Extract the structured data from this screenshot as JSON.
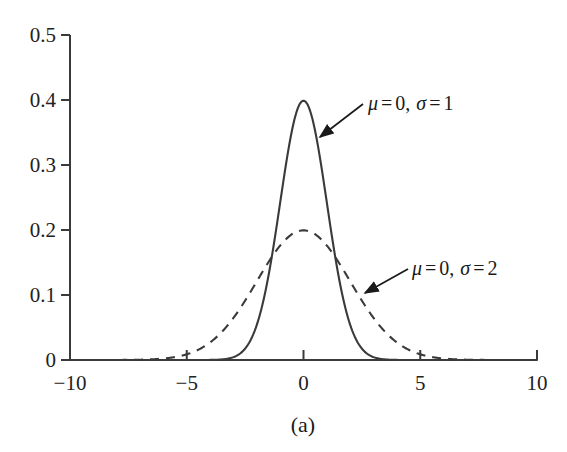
{
  "figure": {
    "caption": "(a)",
    "background_color": "#ffffff",
    "axis_color": "#3a3a3a",
    "curve_color": "#3a3a3a"
  },
  "axes": {
    "x": {
      "label": "",
      "ticks": [
        "−10",
        "−5",
        "0",
        "5",
        "10"
      ],
      "tick_values": [
        -10,
        -5,
        0,
        5,
        10
      ],
      "range": [
        -10,
        10
      ]
    },
    "y": {
      "label": "",
      "ticks": [
        "0",
        "0.1",
        "0.2",
        "0.3",
        "0.4",
        "0.5"
      ],
      "tick_values": [
        0,
        0.1,
        0.2,
        0.3,
        0.4,
        0.5
      ],
      "range": [
        0,
        0.5
      ]
    }
  },
  "annotations": [
    {
      "id": "sigma-1",
      "text": "μ = 0, σ = 1",
      "mu_symbol": "μ",
      "sigma_symbol": "σ",
      "mu_value": "0",
      "sigma_value": "1",
      "text_x": 368,
      "text_y": 110,
      "arrow_from": [
        363,
        104
      ],
      "arrow_to": [
        320,
        137
      ]
    },
    {
      "id": "sigma-2",
      "text": "μ = 0, σ = 2",
      "mu_symbol": "μ",
      "sigma_symbol": "σ",
      "mu_value": "0",
      "sigma_value": "2",
      "text_x": 412,
      "text_y": 275,
      "arrow_from": [
        408,
        269
      ],
      "arrow_to": [
        365,
        293
      ]
    }
  ],
  "chart_data": {
    "type": "line",
    "title": "",
    "xlabel": "",
    "ylabel": "",
    "xlim": [
      -10,
      10
    ],
    "ylim": [
      0,
      0.5
    ],
    "grid": false,
    "legend": "annotations-inline",
    "xticks": [
      -10,
      -5,
      0,
      5,
      10
    ],
    "yticks": [
      0,
      0.1,
      0.2,
      0.3,
      0.4,
      0.5
    ],
    "series": [
      {
        "name": "μ = 0, σ = 1",
        "mu": 0,
        "sigma": 1,
        "style": "solid",
        "color": "#3a3a3a",
        "peak": 0.3989,
        "x": [
          -10,
          -9,
          -8,
          -7,
          -6,
          -5,
          -4.5,
          -4,
          -3.5,
          -3,
          -2.5,
          -2,
          -1.5,
          -1,
          -0.5,
          0,
          0.5,
          1,
          1.5,
          2,
          2.5,
          3,
          3.5,
          4,
          4.5,
          5,
          6,
          7,
          8,
          9,
          10
        ],
        "y": [
          0.0,
          0.0,
          0.0,
          0.0,
          0.0,
          1.5e-06,
          1.6e-05,
          0.0001338,
          0.0008727,
          0.0044318,
          0.0175283,
          0.053991,
          0.1295176,
          0.2419707,
          0.3520653,
          0.3989423,
          0.3520653,
          0.2419707,
          0.1295176,
          0.053991,
          0.0175283,
          0.0044318,
          0.0008727,
          0.0001338,
          1.6e-05,
          1.5e-06,
          0.0,
          0.0,
          0.0,
          0.0,
          0.0
        ]
      },
      {
        "name": "μ = 0, σ = 2",
        "mu": 0,
        "sigma": 2,
        "style": "dashed",
        "color": "#3a3a3a",
        "peak": 0.1995,
        "x": [
          -10,
          -9,
          -8,
          -7,
          -6,
          -5,
          -4.5,
          -4,
          -3.5,
          -3,
          -2.5,
          -2,
          -1.5,
          -1,
          -0.5,
          0,
          0.5,
          1,
          1.5,
          2,
          2.5,
          3,
          3.5,
          4,
          4.5,
          5,
          6,
          7,
          8,
          9,
          10
        ],
        "y": [
          1e-07,
          2.2e-06,
          2.68e-05,
          0.0002187,
          0.0012238,
          0.0045553,
          0.0079155,
          0.0134977,
          0.0218171,
          0.0332986,
          0.0478867,
          0.0647588,
          0.0822621,
          0.0979907,
          0.1093943,
          0.1994711,
          0.1093943,
          0.0979907,
          0.0822621,
          0.0647588,
          0.0478867,
          0.0332986,
          0.0218171,
          0.0134977,
          0.0079155,
          0.0045553,
          0.0012238,
          0.0002187,
          2.68e-05,
          2.2e-06,
          1e-07
        ]
      }
    ]
  },
  "geometry": {
    "plot_left_px": 70,
    "plot_right_px": 537,
    "plot_bottom_px": 360,
    "plot_top_px": 35
  }
}
